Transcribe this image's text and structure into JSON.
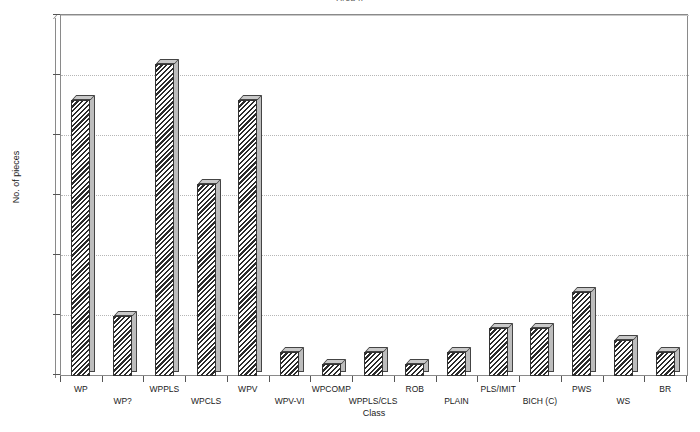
{
  "chart_data": {
    "type": "bar",
    "title": "Area II",
    "xlabel": "Class",
    "ylabel": "No. of pieces",
    "categories": [
      "WP",
      "WP?",
      "WPPLS",
      "WPCLS",
      "WPV",
      "WPV-VI",
      "WPCOMP",
      "WPPLS/CLS",
      "ROB",
      "PLAIN",
      "PLS/IMIT",
      "BICH (C)",
      "PWS",
      "WS",
      "BR"
    ],
    "values": [
      23,
      5,
      26,
      16,
      23,
      2,
      1,
      2,
      1,
      2,
      4,
      4,
      7,
      3,
      2
    ],
    "ylim": [
      0,
      30
    ],
    "ytick_labels": [
      "0",
      "5",
      "10",
      "15",
      "20",
      "25",
      "30"
    ],
    "ytick_values": [
      0,
      5,
      10,
      15,
      20,
      25,
      30
    ],
    "grid": true,
    "legend": "none",
    "bar_style": "3d-diagonal-hatch",
    "colors": {
      "bar_hatch": "#2b2b2b",
      "bar_background": "#ffffff",
      "bar_top_face": "#c9c9c9",
      "bar_side_face": "#bdbdbd",
      "axis": "#8a8a8a",
      "gridline": "#b6b6b6",
      "text": "#1a1a1a",
      "plot_background": "#ffffff"
    }
  }
}
